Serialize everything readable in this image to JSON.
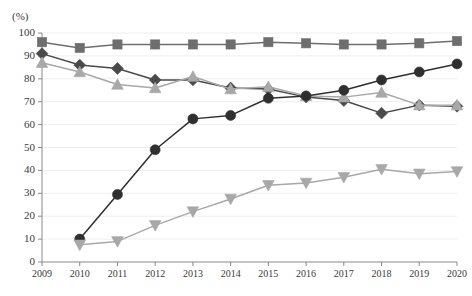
{
  "axis": {
    "unit_label": "(%)",
    "y_ticks": [
      0,
      10,
      20,
      30,
      40,
      50,
      60,
      70,
      80,
      90,
      100
    ],
    "x_ticks": [
      "2009",
      "2010",
      "2011",
      "2012",
      "2013",
      "2014",
      "2015",
      "2016",
      "2017",
      "2018",
      "2019",
      "2020"
    ]
  },
  "colors": {
    "square_series": "#6e6e6e",
    "diamond_series": "#4a4a4a",
    "up_triangle_series": "#a8a8a8",
    "circle_series": "#2f2f2f",
    "down_triangle_series": "#a8a8a8",
    "gridline": "#eeeef2",
    "axis": "#888888",
    "text": "#3a3a3a"
  },
  "chart_data": {
    "type": "line",
    "title": "",
    "subtitle": "",
    "xlabel": "",
    "ylabel": "(%)",
    "ylim": [
      0,
      100
    ],
    "ytick_step": 10,
    "grid": true,
    "legend_position": "none",
    "x": [
      "2009",
      "2010",
      "2011",
      "2012",
      "2013",
      "2014",
      "2015",
      "2016",
      "2017",
      "2018",
      "2019",
      "2020"
    ],
    "categories": [
      "2009",
      "2010",
      "2011",
      "2012",
      "2013",
      "2014",
      "2015",
      "2016",
      "2017",
      "2018",
      "2019",
      "2020"
    ],
    "series": [
      {
        "name": "square-series",
        "marker": "square",
        "color": "#6e6e6e",
        "values": [
          96.0,
          93.5,
          95.0,
          95.0,
          95.0,
          95.0,
          96.0,
          95.5,
          95.0,
          95.0,
          95.5,
          96.5
        ]
      },
      {
        "name": "diamond-series",
        "marker": "diamond",
        "color": "#4a4a4a",
        "values": [
          91.0,
          86.0,
          84.5,
          79.5,
          79.5,
          76.0,
          75.5,
          72.0,
          70.5,
          65.0,
          68.5,
          68.0
        ]
      },
      {
        "name": "up-triangle-series",
        "marker": "triangle-up",
        "color": "#a8a8a8",
        "values": [
          87.0,
          83.0,
          77.5,
          76.0,
          81.0,
          75.5,
          76.5,
          72.5,
          72.0,
          74.0,
          68.5,
          68.5
        ]
      },
      {
        "name": "circle-series",
        "marker": "circle",
        "color": "#2f2f2f",
        "values": [
          null,
          10.0,
          29.5,
          49.0,
          62.5,
          64.0,
          71.5,
          72.5,
          75.0,
          79.5,
          83.0,
          86.5
        ]
      },
      {
        "name": "down-triangle-series",
        "marker": "triangle-down",
        "color": "#a8a8a8",
        "values": [
          null,
          7.5,
          9.0,
          16.0,
          22.0,
          27.5,
          33.5,
          34.5,
          37.0,
          40.5,
          38.5,
          39.5
        ]
      }
    ]
  }
}
